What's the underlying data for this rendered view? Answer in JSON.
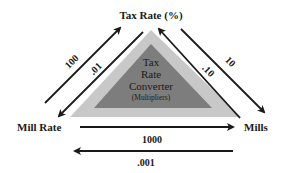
{
  "diagram": {
    "title_center": {
      "line1": "Tax",
      "line2": "Rate",
      "line3": "Converter",
      "line4": "(Multipliers)"
    },
    "nodes": {
      "top": "Tax Rate (%)",
      "left": "Mill Rate",
      "right": "Mills"
    },
    "edges": {
      "mill_rate_to_tax_rate": "100",
      "tax_rate_to_mill_rate": ".01",
      "tax_rate_to_mills": "10",
      "mills_to_tax_rate": ".10",
      "mill_rate_to_mills": "1000",
      "mills_to_mill_rate": ".001"
    },
    "colors": {
      "outer_triangle": "#c8c8c8",
      "inner_triangle": "#7d7d7d",
      "arrow": "#1a1a1a",
      "text": "#1a1a1a"
    }
  }
}
